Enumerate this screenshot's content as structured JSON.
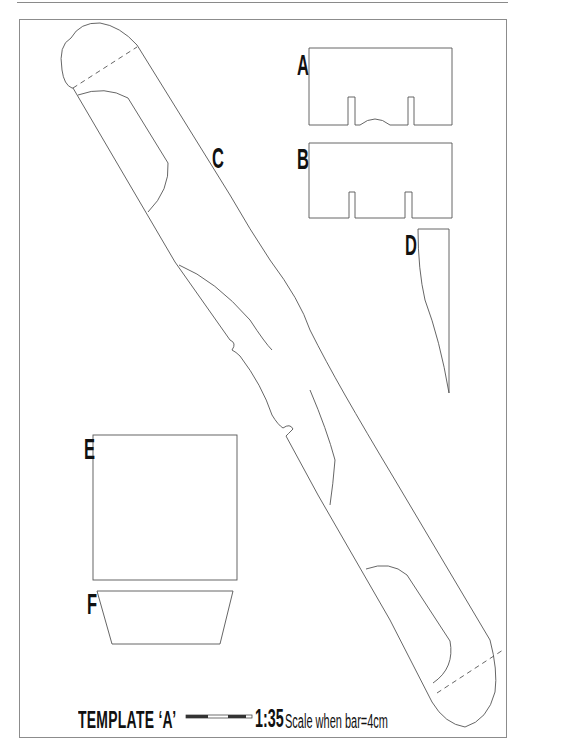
{
  "sheet": {
    "title": "TEMPLATE ‘A’",
    "scale_ratio": "1:35",
    "scale_note": "Scale when bar=4cm",
    "scale_bar": {
      "length_cm": 4,
      "segments": [
        "dark",
        "light",
        "dark",
        "light"
      ]
    },
    "colors": {
      "line": "#555555",
      "label": "#111111",
      "frame": "#8c8c8c",
      "background": "#ffffff"
    }
  },
  "pieces": [
    {
      "id": "A",
      "label": "A",
      "shape": "rectangle with two bottom slots and central arch notch"
    },
    {
      "id": "B",
      "label": "B",
      "shape": "rectangle with two bottom slots"
    },
    {
      "id": "C",
      "label": "C",
      "shape": "long diagonal strip with rounded ends, dashed fold lines and notches"
    },
    {
      "id": "D",
      "label": "D",
      "shape": "tall tapered sliver"
    },
    {
      "id": "E",
      "label": "E",
      "shape": "square"
    },
    {
      "id": "F",
      "label": "F",
      "shape": "trapezoid"
    }
  ]
}
